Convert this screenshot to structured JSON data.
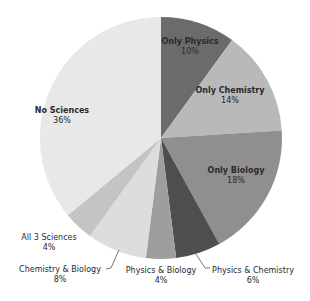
{
  "chart_data": {
    "type": "pie",
    "title": "",
    "start_angle_deg": 0,
    "direction": "clockwise",
    "slices": [
      {
        "label": "Only Physics",
        "value": 10,
        "pct_label": "10%",
        "color": "#6b6b6b",
        "label_pos": [
          190,
          47
        ],
        "outside": false
      },
      {
        "label": "Only Chemistry",
        "value": 14,
        "pct_label": "14%",
        "color": "#b9b9b9",
        "label_pos": [
          230,
          96
        ],
        "outside": false
      },
      {
        "label": "Only Biology",
        "value": 18,
        "pct_label": "18%",
        "color": "#8f8f8f",
        "label_pos": [
          236,
          176
        ],
        "outside": false
      },
      {
        "label": "Physics & Chemistry",
        "value": 6,
        "pct_label": "6%",
        "color": "#4e4e4e",
        "label_pos": [
          253,
          276
        ],
        "outside": true
      },
      {
        "label": "Physics & Biology",
        "value": 4,
        "pct_label": "4%",
        "color": "#9e9e9e",
        "label_pos": [
          161,
          276
        ],
        "outside": true
      },
      {
        "label": "Chemistry & Biology",
        "value": 8,
        "pct_label": "8%",
        "color": "#dddddd",
        "label_pos": [
          60,
          275
        ],
        "outside": true
      },
      {
        "label": "All 3 Sciences",
        "value": 4,
        "pct_label": "4%",
        "color": "#c4c4c4",
        "label_pos": [
          49,
          243
        ],
        "outside": true
      },
      {
        "label": "No Sciences",
        "value": 36,
        "pct_label": "36%",
        "color": "#e8e8e8",
        "label_pos": [
          62,
          116
        ],
        "outside": false
      }
    ],
    "center": [
      161,
      138
    ],
    "radius": 121,
    "leader_lines": [
      {
        "slice": "Physics & Chemistry",
        "points": [
          [
            196,
            254
          ],
          [
            205,
            268
          ],
          [
            210,
            268
          ]
        ]
      },
      {
        "slice": "Chemistry & Biology",
        "points": [
          [
            119,
            250
          ],
          [
            111,
            268
          ],
          [
            106,
            269
          ]
        ]
      }
    ],
    "legend": null
  }
}
